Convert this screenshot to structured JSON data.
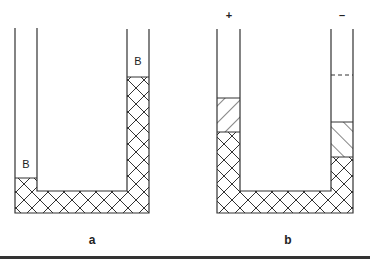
{
  "figure": {
    "panels": [
      {
        "id": "a",
        "caption": "a",
        "left_arm_label": "B",
        "right_arm_label": "B",
        "description": "U-tube with cross-hatched fluid; left arm level low, right arm level high"
      },
      {
        "id": "b",
        "caption": "b",
        "left_electrode_label": "+",
        "right_electrode_label": "–",
        "description": "U-tube with cross-hatched fluid, diagonal-hatched layers above in each arm; dashed line in right arm"
      }
    ],
    "colors": {
      "line": "#333333",
      "background": "#ffffff"
    }
  }
}
